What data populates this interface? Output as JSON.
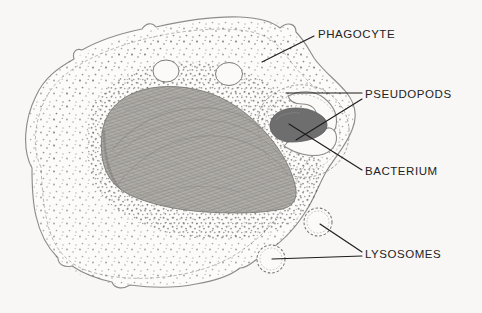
{
  "figure": {
    "medium": "pencil-drawing",
    "background_color": "#f8f7f5",
    "width": 482,
    "height": 313
  },
  "labels": [
    {
      "id": "phagocyte",
      "text": "PHAGOCYTE",
      "x": 318,
      "y": 29,
      "leaders": 1
    },
    {
      "id": "pseudopods",
      "text": "PSEUDOPODS",
      "x": 365,
      "y": 89,
      "leaders": 2
    },
    {
      "id": "bacterium",
      "text": "BACTERIUM",
      "x": 365,
      "y": 166,
      "leaders": 1
    },
    {
      "id": "lysosomes",
      "text": "LYSOSOMES",
      "x": 365,
      "y": 249,
      "leaders": 2
    }
  ],
  "structures": {
    "cell_membrane": {
      "name": "phagocyte cell membrane",
      "style": "double wavy outline",
      "stroke": "#8d8a86"
    },
    "cytoplasm": {
      "name": "cytoplasm",
      "style": "stippled",
      "stipple_color": "#6f6c68"
    },
    "nucleus": {
      "name": "nucleus",
      "style": "hatched fibrous shading",
      "fill": "#a9a6a2"
    },
    "bacterium": {
      "name": "bacterium",
      "style": "solid rod",
      "fill": "#6e6e6e"
    },
    "pseudopods": {
      "name": "pseudopods",
      "count": 2,
      "style": "curved arms surrounding bacterium"
    },
    "lysosomes": {
      "name": "lysosomes",
      "count": 2,
      "style": "stippled circular vesicles"
    },
    "vacuoles": {
      "name": "vacuoles",
      "count": 2,
      "style": "small open circles"
    }
  },
  "colors": {
    "ink": "#232323",
    "leader_line": "#1d1d1d",
    "membrane": "#8d8a86",
    "nucleus_fill": "#a9a6a2",
    "bacterium_fill": "#6e6e6e",
    "background": "#f8f7f5"
  }
}
